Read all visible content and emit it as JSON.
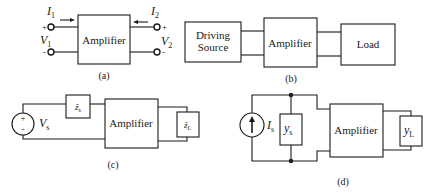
{
  "figure": {
    "panel_a": {
      "caption": "(a)",
      "block_label": "Amplifier",
      "input_current": {
        "symbol": "I",
        "subscript": "1"
      },
      "output_current": {
        "symbol": "I",
        "subscript": "2"
      },
      "input_voltage": {
        "symbol": "V",
        "subscript": "1"
      },
      "output_voltage": {
        "symbol": "V",
        "subscript": "2"
      },
      "plus": "+",
      "minus": "-"
    },
    "panel_b": {
      "caption": "(b)",
      "source_label_line1": "Driving",
      "source_label_line2": "Source",
      "block_label": "Amplifier",
      "load_label": "Load"
    },
    "panel_c": {
      "caption": "(c)",
      "source_voltage": {
        "symbol": "V",
        "subscript": "s"
      },
      "source_impedance": {
        "symbol": "ẑ",
        "subscript": "s"
      },
      "block_label": "Amplifier",
      "load_impedance": {
        "symbol": "ẑ",
        "subscript": "L"
      },
      "plus": "+",
      "minus": "-"
    },
    "panel_d": {
      "caption": "(d)",
      "source_current": {
        "symbol": "I",
        "subscript": "s"
      },
      "source_admittance": {
        "symbol": "y",
        "subscript": "s"
      },
      "block_label": "Amplifier",
      "load_admittance": {
        "symbol": "y",
        "subscript": "L"
      }
    }
  }
}
